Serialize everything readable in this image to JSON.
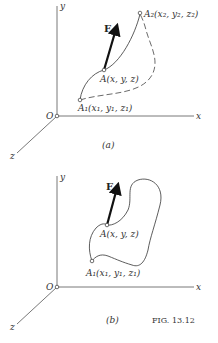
{
  "figure_label": "FIG. 13.12",
  "panels": [
    {
      "caption": "(a)",
      "axes": {
        "x": "x",
        "y": "y",
        "z": "z",
        "origin": "O"
      },
      "force_label": "F",
      "points": {
        "A": "A(x, y, z)",
        "A1": "A₁(x₁, y₁, z₁)",
        "A2": "A₂(x₂, y₂, z₂)"
      },
      "path_type": "open (two alternative paths: solid and dashed)"
    },
    {
      "caption": "(b)",
      "axes": {
        "x": "x",
        "y": "y",
        "z": "z",
        "origin": "O"
      },
      "force_label": "F",
      "points": {
        "A": "A(x, y, z)",
        "A1": "A₁(x₁, y₁, z₁)"
      },
      "path_type": "closed"
    }
  ]
}
